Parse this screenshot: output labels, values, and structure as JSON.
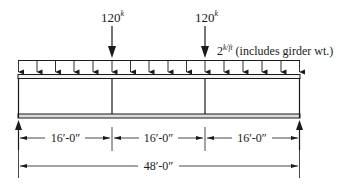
{
  "diagram": {
    "type": "beam-loading",
    "point_loads": [
      {
        "value": "120",
        "unit": "k",
        "x_ft": 16
      },
      {
        "value": "120",
        "unit": "k",
        "x_ft": 32
      }
    ],
    "distributed_load": {
      "value": "2",
      "unit": "k/ft",
      "note": "(includes girder wt.)"
    },
    "segment_dimensions": [
      "16′-0″",
      "16′-0″",
      "16′-0″"
    ],
    "total_dimension": "48′-0″",
    "supports": [
      "left-reaction",
      "right-reaction"
    ],
    "colors": {
      "line": "#1a1a1a",
      "background": "#ffffff"
    }
  }
}
